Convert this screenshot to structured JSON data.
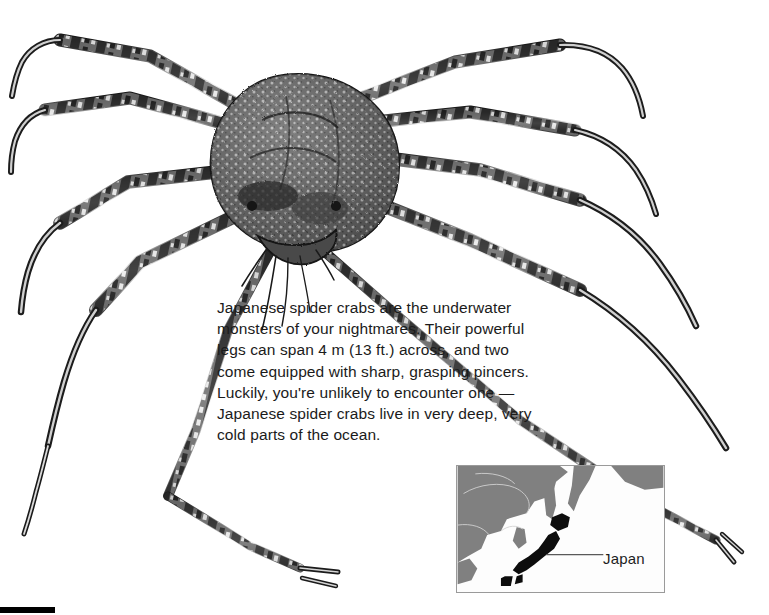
{
  "page": {
    "background_color": "#ffffff"
  },
  "caption": {
    "text": "Japanese spider crabs are the underwater monsters of your nightmares. Their powerful legs can span 4 m (13 ft.) across, and two come equipped with sharp, grasping pincers. Luckily, you're unlikely to encounter one — Japanese spider crabs live in very deep, very cold parts of the ocean."
  },
  "illustration": {
    "name": "japanese-spider-crab",
    "style": "black-and-white stippled engraving",
    "body_color": "#4a4a4a",
    "leg_color": "#3d3d3d",
    "leg_count": 8,
    "pincer_count": 2
  },
  "inset_map": {
    "title": "East Asia locator map",
    "highlight_label": "Japan",
    "land_color": "#808080",
    "sea_color": "#fdfdfd",
    "highlight_color": "#0d0d0d",
    "border_color": "#9a9a9a",
    "coastline_color": "#d0d0d0"
  },
  "bottom_bar": {
    "color": "#000000"
  }
}
